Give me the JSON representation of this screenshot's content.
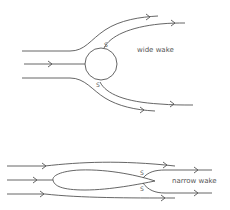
{
  "diagrams": [
    {
      "name": "bluff-body",
      "shape": "circle",
      "wake_label": "wide wake",
      "separation_top": "S",
      "separation_bottom": "S"
    },
    {
      "name": "streamlined-body",
      "shape": "airfoil",
      "wake_label": "narrow wake",
      "separation_top": "S",
      "separation_bottom": "S"
    }
  ],
  "colors": {
    "stroke": "#555555",
    "background": "#ffffff"
  }
}
